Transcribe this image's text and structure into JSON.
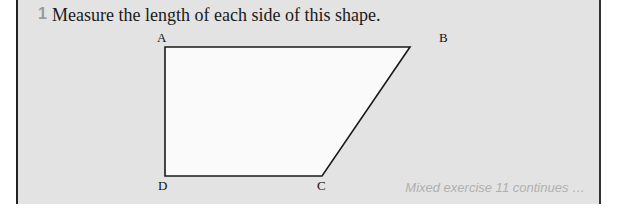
{
  "question": {
    "number": "1",
    "text": "Measure the length of each side of this shape."
  },
  "shape": {
    "vertices": [
      {
        "label": "A",
        "x": 165,
        "y": 47
      },
      {
        "label": "B",
        "x": 410,
        "y": 47
      },
      {
        "label": "C",
        "x": 322,
        "y": 176
      },
      {
        "label": "D",
        "x": 165,
        "y": 176
      }
    ],
    "fill": "#fafafa",
    "stroke": "#1a1a1a"
  },
  "footer": {
    "text": "Mixed exercise 11 continues …"
  },
  "colors": {
    "panel_bg": "#e3e3e3",
    "question_number": "#9a9a9a",
    "footer_text": "#b0b0b0"
  }
}
